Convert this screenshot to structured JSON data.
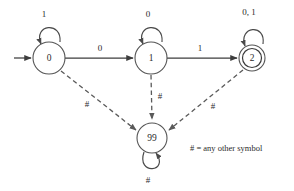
{
  "diagram": {
    "background_color": "#ffffff",
    "stroke_color": "#3d3d3d",
    "dashed_stroke_color": "#5a5a5a",
    "text_color": "#2b2b2b"
  },
  "states": [
    {
      "id": "0",
      "label": "0",
      "cx": 49,
      "cy": 58,
      "r": 16,
      "accepting": false,
      "start": true
    },
    {
      "id": "1",
      "label": "1",
      "cx": 151,
      "cy": 58,
      "r": 16,
      "accepting": false,
      "start": false
    },
    {
      "id": "2",
      "label": "2",
      "cx": 252,
      "cy": 58,
      "r": 13,
      "accepting": true,
      "start": false
    },
    {
      "id": "99",
      "label": "99",
      "cx": 152,
      "cy": 138,
      "r": 15,
      "accepting": false,
      "start": false
    }
  ],
  "self_loops": [
    {
      "state": "0",
      "label": "1",
      "label_x": 44,
      "label_y": 14
    },
    {
      "state": "1",
      "label": "0",
      "label_x": 148,
      "label_y": 14
    },
    {
      "state": "2",
      "label": "0, 1",
      "label_x": 249,
      "label_y": 12
    },
    {
      "state": "99",
      "label": "#",
      "label_x": 148,
      "label_y": 180
    }
  ],
  "transitions": [
    {
      "from": "0",
      "to": "1",
      "label": "0",
      "style": "solid",
      "label_x": 100,
      "label_y": 48
    },
    {
      "from": "1",
      "to": "2",
      "label": "1",
      "style": "solid",
      "label_x": 200,
      "label_y": 48
    },
    {
      "from": "0",
      "to": "99",
      "label": "#",
      "style": "dashed",
      "label_x": 87,
      "label_y": 104
    },
    {
      "from": "1",
      "to": "99",
      "label": "#",
      "style": "dashed",
      "label_x": 159,
      "label_y": 96
    },
    {
      "from": "2",
      "to": "99",
      "label": "#",
      "style": "dashed",
      "label_x": 212,
      "label_y": 106
    }
  ],
  "start_marker": {
    "name": "start-arrow",
    "from_x": 14,
    "to_x": 31,
    "y": 58
  },
  "legend": {
    "text": "# = any other symbol",
    "x": 190,
    "y": 148
  }
}
